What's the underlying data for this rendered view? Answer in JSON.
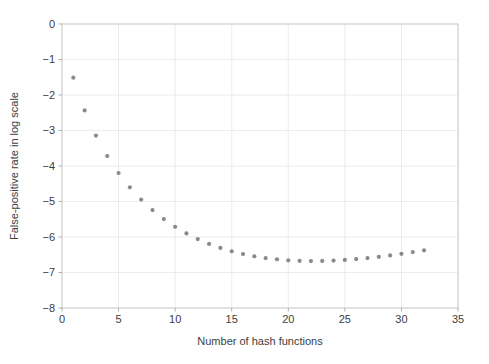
{
  "chart_data": {
    "type": "scatter",
    "title": "",
    "xlabel": "Number of hash functions",
    "ylabel": "False-positive rate in log scale",
    "xlim": [
      0,
      35
    ],
    "ylim": [
      -8,
      0
    ],
    "x_ticks": [
      0,
      5,
      10,
      15,
      20,
      25,
      30,
      35
    ],
    "x_tick_labels": [
      "0",
      "5",
      "10",
      "15",
      "20",
      "25",
      "30",
      "35"
    ],
    "y_ticks": [
      0,
      -1,
      -2,
      -3,
      -4,
      -5,
      -6,
      -7,
      -8
    ],
    "y_tick_labels": [
      "0",
      "−1",
      "−2",
      "−3",
      "−4",
      "−5",
      "−6",
      "−7",
      "−8"
    ],
    "grid": true,
    "legend": "none",
    "series": [
      {
        "name": "false-positive-rate-log10",
        "x": [
          1,
          2,
          3,
          4,
          5,
          6,
          7,
          8,
          9,
          10,
          11,
          12,
          13,
          14,
          15,
          16,
          17,
          18,
          19,
          20,
          21,
          22,
          23,
          24,
          25,
          26,
          27,
          28,
          29,
          30,
          31,
          32
        ],
        "y": [
          -1.511,
          -2.435,
          -3.143,
          -3.72,
          -4.197,
          -4.601,
          -4.947,
          -5.242,
          -5.495,
          -5.712,
          -5.899,
          -6.058,
          -6.194,
          -6.308,
          -6.403,
          -6.481,
          -6.544,
          -6.594,
          -6.63,
          -6.656,
          -6.671,
          -6.677,
          -6.674,
          -6.664,
          -6.647,
          -6.623,
          -6.593,
          -6.558,
          -6.519,
          -6.474,
          -6.426,
          -6.374
        ]
      }
    ],
    "marker": {
      "shape": "circle",
      "size_px": 4.2,
      "color": "#8a8a8a"
    }
  },
  "style": {
    "background": "#ffffff",
    "grid_color": "#ebebeb",
    "frame_color": "#cdcdcd",
    "tick_color": "#b0b0b0",
    "text_color": "#3d3d3d"
  }
}
